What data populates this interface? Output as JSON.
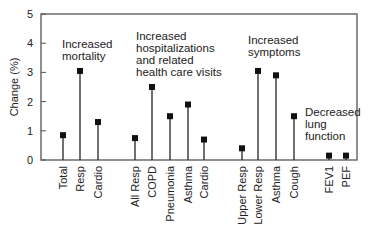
{
  "chart_data": {
    "type": "bar",
    "subtype": "lollipop",
    "title": "",
    "xlabel": "",
    "ylabel": "Change (%)",
    "ylim": [
      0,
      5
    ],
    "yticks": [
      0,
      1,
      2,
      3,
      4,
      5
    ],
    "grid": false,
    "categories": [
      "Total",
      "Resp",
      "Cardio",
      "All Resp",
      "COPD",
      "Pneumonia",
      "Asthma",
      "Cardio",
      "Upper Resp",
      "Lower Resp",
      "Asthma",
      "Cough",
      "FEV1",
      "PEF"
    ],
    "values": [
      0.85,
      3.05,
      1.3,
      0.75,
      2.5,
      1.5,
      1.9,
      0.7,
      0.4,
      3.05,
      2.9,
      1.5,
      0.15,
      0.15
    ],
    "groups": [
      {
        "name": "Increased mortality",
        "categories": [
          "Total",
          "Resp",
          "Cardio"
        ],
        "values": [
          0.85,
          3.05,
          1.3
        ]
      },
      {
        "name": "Increased hospitalizations and related health care visits",
        "categories": [
          "All Resp",
          "COPD",
          "Pneumonia",
          "Asthma",
          "Cardio"
        ],
        "values": [
          0.75,
          2.5,
          1.5,
          1.9,
          0.7
        ]
      },
      {
        "name": "Increased symptoms",
        "categories": [
          "Upper Resp",
          "Lower Resp",
          "Asthma",
          "Cough"
        ],
        "values": [
          0.4,
          3.05,
          2.9,
          1.5
        ]
      },
      {
        "name": "Decreased lung function",
        "categories": [
          "FEV1",
          "PEF"
        ],
        "values": [
          0.15,
          0.15
        ]
      }
    ],
    "annotations": [
      {
        "lines": [
          "Increased",
          "mortality"
        ],
        "x": 62,
        "y": 48
      },
      {
        "lines": [
          "Increased",
          "hospitalizations",
          "and related",
          "health care visits"
        ],
        "x": 136,
        "y": 40
      },
      {
        "lines": [
          "Increased",
          "symptoms"
        ],
        "x": 248,
        "y": 44
      },
      {
        "lines": [
          "Decreased",
          "lung",
          "function"
        ],
        "x": 305,
        "y": 116
      }
    ]
  }
}
